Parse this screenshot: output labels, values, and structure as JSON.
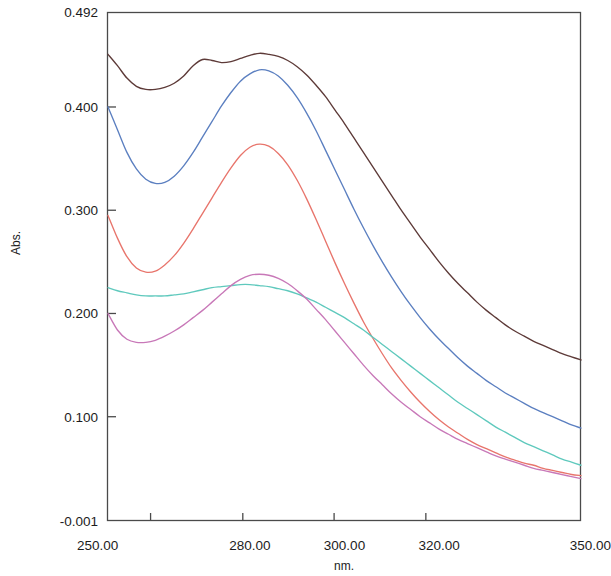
{
  "chart_data": {
    "type": "line",
    "title": "",
    "xlabel": "nm.",
    "ylabel": "Abs.",
    "xlim": [
      250.0,
      350.0
    ],
    "ylim": [
      -0.001,
      0.492
    ],
    "grid": false,
    "legend": "none",
    "x_tick_labels": [
      "250.00",
      "280.00",
      "300.00",
      "320.00",
      "350.00"
    ],
    "x_tick_values": [
      250.0,
      280.0,
      300.0,
      320.0,
      350.0
    ],
    "x_tick_marks": [
      250.0,
      259.0,
      278.5,
      297.8,
      317.2,
      350.0
    ],
    "y_tick_labels": [
      "0.492",
      "0.400",
      "0.300",
      "0.200",
      "0.100",
      "-0.001"
    ],
    "y_tick_values": [
      0.492,
      0.4,
      0.3,
      0.2,
      0.1,
      -0.001
    ],
    "x": [
      250,
      252,
      254,
      256,
      258,
      260,
      262,
      264,
      266,
      268,
      270,
      272,
      274,
      276,
      278,
      280,
      282,
      284,
      286,
      288,
      290,
      292,
      294,
      296,
      298,
      300,
      302,
      304,
      306,
      308,
      310,
      312,
      314,
      316,
      318,
      320,
      322,
      324,
      326,
      328,
      330,
      332,
      334,
      336,
      338,
      340,
      342,
      344,
      346,
      348,
      350
    ],
    "series": [
      {
        "name": "curve-1-dark-maroon",
        "color": "#5d3a38",
        "values": [
          0.451,
          0.44,
          0.428,
          0.42,
          0.417,
          0.417,
          0.419,
          0.423,
          0.43,
          0.44,
          0.446,
          0.445,
          0.443,
          0.444,
          0.447,
          0.45,
          0.452,
          0.451,
          0.449,
          0.445,
          0.439,
          0.431,
          0.421,
          0.41,
          0.397,
          0.384,
          0.37,
          0.356,
          0.342,
          0.328,
          0.314,
          0.3,
          0.287,
          0.274,
          0.262,
          0.25,
          0.239,
          0.229,
          0.22,
          0.211,
          0.203,
          0.196,
          0.189,
          0.183,
          0.178,
          0.173,
          0.169,
          0.165,
          0.161,
          0.158,
          0.155
        ]
      },
      {
        "name": "curve-2-steel-blue",
        "color": "#5b7fc0",
        "values": [
          0.4,
          0.378,
          0.356,
          0.34,
          0.33,
          0.326,
          0.327,
          0.333,
          0.343,
          0.356,
          0.371,
          0.386,
          0.401,
          0.414,
          0.425,
          0.432,
          0.436,
          0.435,
          0.43,
          0.421,
          0.409,
          0.394,
          0.377,
          0.358,
          0.339,
          0.32,
          0.301,
          0.283,
          0.266,
          0.25,
          0.235,
          0.221,
          0.208,
          0.196,
          0.185,
          0.175,
          0.166,
          0.157,
          0.149,
          0.142,
          0.135,
          0.129,
          0.123,
          0.118,
          0.113,
          0.108,
          0.104,
          0.1,
          0.096,
          0.092,
          0.089
        ]
      },
      {
        "name": "curve-3-salmon-red",
        "color": "#e8756c",
        "values": [
          0.295,
          0.273,
          0.255,
          0.244,
          0.24,
          0.241,
          0.247,
          0.256,
          0.268,
          0.282,
          0.297,
          0.312,
          0.327,
          0.341,
          0.353,
          0.361,
          0.364,
          0.362,
          0.355,
          0.344,
          0.329,
          0.311,
          0.291,
          0.27,
          0.249,
          0.229,
          0.21,
          0.192,
          0.176,
          0.161,
          0.147,
          0.135,
          0.124,
          0.114,
          0.105,
          0.097,
          0.09,
          0.084,
          0.078,
          0.073,
          0.069,
          0.065,
          0.061,
          0.058,
          0.055,
          0.053,
          0.05,
          0.048,
          0.046,
          0.044,
          0.043
        ]
      },
      {
        "name": "curve-4-cyan-teal",
        "color": "#5fc9bd",
        "values": [
          0.225,
          0.222,
          0.22,
          0.218,
          0.217,
          0.217,
          0.217,
          0.218,
          0.219,
          0.221,
          0.223,
          0.225,
          0.226,
          0.227,
          0.228,
          0.228,
          0.227,
          0.226,
          0.224,
          0.222,
          0.219,
          0.215,
          0.211,
          0.206,
          0.201,
          0.196,
          0.19,
          0.184,
          0.177,
          0.17,
          0.163,
          0.156,
          0.149,
          0.142,
          0.135,
          0.128,
          0.121,
          0.114,
          0.108,
          0.102,
          0.096,
          0.09,
          0.085,
          0.08,
          0.075,
          0.071,
          0.067,
          0.063,
          0.059,
          0.056,
          0.053
        ]
      },
      {
        "name": "curve-5-magenta-pink",
        "color": "#c878b8",
        "values": [
          0.2,
          0.184,
          0.175,
          0.172,
          0.172,
          0.174,
          0.178,
          0.183,
          0.189,
          0.196,
          0.203,
          0.211,
          0.219,
          0.227,
          0.233,
          0.237,
          0.238,
          0.237,
          0.234,
          0.229,
          0.222,
          0.214,
          0.204,
          0.194,
          0.183,
          0.172,
          0.161,
          0.15,
          0.14,
          0.131,
          0.122,
          0.114,
          0.107,
          0.1,
          0.094,
          0.088,
          0.083,
          0.078,
          0.074,
          0.07,
          0.066,
          0.062,
          0.059,
          0.056,
          0.053,
          0.05,
          0.048,
          0.046,
          0.044,
          0.042,
          0.04
        ]
      }
    ]
  },
  "axes": {
    "y_axis_title": "Abs.",
    "x_axis_title": "nm."
  }
}
